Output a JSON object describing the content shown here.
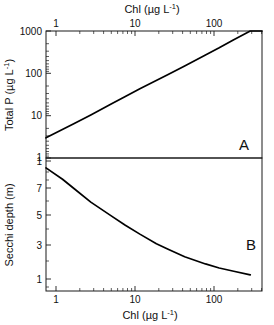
{
  "figure": {
    "name": "chl-totalp-secchi-figure",
    "background_color": "#ffffff",
    "line_color": "#000000",
    "axis_color": "#1a1a1a"
  },
  "panel_a": {
    "label": "A",
    "top_axis_title_main": "Chl (",
    "top_axis_title_unit": "µg L",
    "top_axis_title_exp": "-1",
    "top_axis_title_close": ")",
    "top_axis_title_full": "Chl (µg L-1)",
    "y_axis_title_main": "Total P (",
    "y_axis_title_unit": "µg L",
    "y_axis_title_exp": "-1",
    "y_axis_title_close": ")",
    "y_axis_title_full": "Total P (µg L-1)",
    "x_ticklabels": [
      "1",
      "10",
      "100"
    ],
    "y_ticklabels": [
      "1000",
      "100",
      "10",
      "1"
    ]
  },
  "panel_b": {
    "label": "B",
    "bottom_axis_title_main": "Chl (",
    "bottom_axis_title_unit": "µg L",
    "bottom_axis_title_exp": "-1",
    "bottom_axis_title_close": ")",
    "bottom_axis_title_full": "Chl (µg L-1)",
    "y_axis_title": "Secchi depth (m)",
    "x_ticklabels": [
      "1",
      "10",
      "100"
    ],
    "y_ticklabels": [
      "1",
      "7",
      "5",
      "3",
      "1"
    ]
  },
  "chart_data": [
    {
      "type": "line",
      "panel": "A",
      "title": "",
      "xlabel": "Chl (µg L-1)",
      "ylabel": "Total P (µg L-1)",
      "xscale": "log",
      "yscale": "log",
      "xlim": [
        1,
        200
      ],
      "ylim": [
        1,
        1000
      ],
      "xticks": [
        1,
        10,
        100
      ],
      "yticks": [
        1,
        10,
        100,
        1000
      ],
      "xtick_labels": [
        "1",
        "10",
        "100"
      ],
      "ytick_labels": [
        "1",
        "10",
        "100",
        "1000"
      ],
      "xaxis_position": "top",
      "grid": false,
      "legend": false,
      "annotations": [
        {
          "text": "A",
          "x_frac": 0.88,
          "y_frac": 0.09
        }
      ],
      "series": [
        {
          "name": "Total P vs Chl",
          "x": [
            1,
            2,
            3,
            5,
            7,
            10,
            20,
            30,
            50,
            70,
            100,
            150,
            200
          ],
          "y": [
            3.0,
            6.5,
            10.4,
            19.2,
            28.4,
            43.3,
            93.7,
            150.0,
            270.0,
            400.0,
            625.0,
            1000.0,
            1000.0
          ]
        }
      ]
    },
    {
      "type": "line",
      "panel": "B",
      "title": "",
      "xlabel": "Chl (µg L-1)",
      "ylabel": "Secchi depth (m)",
      "xscale": "log",
      "yscale": "log",
      "xlim": [
        1,
        200
      ],
      "ylim": [
        0.5,
        10
      ],
      "xticks": [
        1,
        10,
        100
      ],
      "yticks": [
        1,
        3,
        5,
        7,
        10
      ],
      "xtick_labels": [
        "1",
        "10",
        "100"
      ],
      "ytick_labels": [
        "1",
        "3",
        "5",
        "7",
        "1"
      ],
      "xaxis_position": "bottom",
      "grid": false,
      "legend": false,
      "annotations": [
        {
          "text": "B",
          "x_frac": 0.9,
          "y_frac": 0.55
        }
      ],
      "series": [
        {
          "name": "Secchi depth vs Chl",
          "x": [
            1,
            1.5,
            2,
            3,
            5,
            7,
            10,
            15,
            20,
            30,
            50,
            70,
            100,
            150
          ],
          "y": [
            8.0,
            6.2,
            5.0,
            3.7,
            2.7,
            2.2,
            1.8,
            1.45,
            1.28,
            1.08,
            0.92,
            0.84,
            0.78,
            0.72
          ]
        }
      ]
    }
  ]
}
